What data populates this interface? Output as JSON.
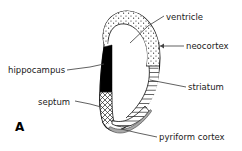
{
  "figure": {
    "panel_letter": "A",
    "width": 242,
    "height": 151,
    "background_color": "#ffffff",
    "ink_color": "#1a1a1a"
  },
  "labels": {
    "ventricle": "ventricle",
    "neocortex": "neocortex",
    "striatum": "striatum",
    "pyriform_cortex": "pyriform cortex",
    "hippocampus": "hippocampus",
    "septum": "septum"
  },
  "regions": [
    {
      "name": "ventricle",
      "label": "ventricle",
      "fill": "white",
      "texture": "none",
      "description": "unshaded interior cavity of the hemisphere"
    },
    {
      "name": "neocortex",
      "label": "neocortex",
      "fill": "#ffffff",
      "texture": "stipple",
      "description": "stippled band along the dorsal and lateral outer rim"
    },
    {
      "name": "hippocampus",
      "label": "hippocampus",
      "fill": "#000000",
      "texture": "solid",
      "description": "solid black wedge on the medial wall"
    },
    {
      "name": "septum",
      "label": "septum",
      "fill": "#ffffff",
      "texture": "cross-hatch",
      "description": "cross-hatched band below the hippocampus on the medial wall"
    },
    {
      "name": "striatum",
      "label": "striatum",
      "fill": "#ffffff",
      "texture": "horizontal-hatch",
      "description": "horizontally lined mass on the lateral-ventral side"
    },
    {
      "name": "pyriform cortex",
      "label": "pyriform cortex",
      "fill": "#b0b0b0",
      "texture": "gray-band",
      "description": "thin gray band curving along the ventral edge"
    }
  ]
}
